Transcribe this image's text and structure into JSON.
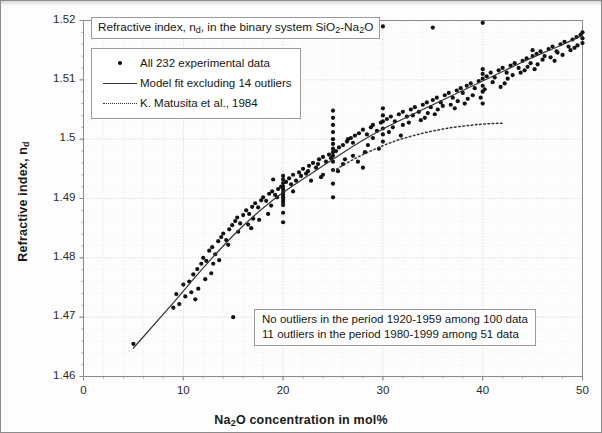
{
  "chart_data": {
    "type": "scatter",
    "title": "Refractive index, nd, in the binary system SiO2-Na2O",
    "title_parts": {
      "lead": "Refractive index, n",
      "sub1": "d",
      "mid": ", in the binary system SiO",
      "sub2": "2",
      "mid2": "-Na",
      "sub3": "2",
      "tail": "O"
    },
    "xlabel": "Na2O concentration in mol%",
    "xlabel_parts": {
      "lead": "Na",
      "sub": "2",
      "tail": "O concentration in mol%"
    },
    "ylabel": "Refractive index, nd",
    "ylabel_parts": {
      "lead": "Refractive index, n",
      "sub": "d"
    },
    "xlim": [
      0,
      50
    ],
    "ylim": [
      1.46,
      1.52
    ],
    "xticks": [
      0,
      10,
      20,
      30,
      40,
      50
    ],
    "xtick_labels": [
      "0",
      "10",
      "20",
      "30",
      "40",
      "50"
    ],
    "yticks": [
      1.46,
      1.47,
      1.48,
      1.49,
      1.5,
      1.51,
      1.52
    ],
    "ytick_labels": [
      "1.46",
      "1.47",
      "1.48",
      "1.49",
      "1.5",
      "1.51",
      "1.52"
    ],
    "x_minor_interval": 2,
    "y_minor_interval": 0.002,
    "grid": true,
    "grid_style": "dotted",
    "grid_color": "#c9c9c9",
    "legend_position": "upper-left",
    "marker_color": "#111111",
    "line_color": "#333333",
    "series": [
      {
        "name": "All 232 experimental data",
        "type": "scatter",
        "marker": "dot",
        "points": [
          [
            5.0,
            1.4655
          ],
          [
            9.3,
            1.4739
          ],
          [
            9.6,
            1.4722
          ],
          [
            10.0,
            1.4755
          ],
          [
            10.2,
            1.4735
          ],
          [
            10.6,
            1.476
          ],
          [
            11.0,
            1.4772
          ],
          [
            11.4,
            1.4781
          ],
          [
            11.8,
            1.479
          ],
          [
            12.0,
            1.48
          ],
          [
            12.3,
            1.4795
          ],
          [
            12.6,
            1.4812
          ],
          [
            12.9,
            1.4818
          ],
          [
            13.2,
            1.4806
          ],
          [
            13.5,
            1.4828
          ],
          [
            13.8,
            1.4835
          ],
          [
            14.0,
            1.4841
          ],
          [
            14.3,
            1.483
          ],
          [
            14.6,
            1.4848
          ],
          [
            14.9,
            1.4855
          ],
          [
            15.0,
            1.47
          ],
          [
            15.2,
            1.4862
          ],
          [
            15.4,
            1.4868
          ],
          [
            15.7,
            1.4858
          ],
          [
            16.0,
            1.4872
          ],
          [
            16.3,
            1.488
          ],
          [
            16.6,
            1.4874
          ],
          [
            16.9,
            1.4886
          ],
          [
            17.2,
            1.4892
          ],
          [
            17.5,
            1.4885
          ],
          [
            17.8,
            1.4897
          ],
          [
            18.0,
            1.4902
          ],
          [
            18.3,
            1.4896
          ],
          [
            18.6,
            1.4908
          ],
          [
            18.9,
            1.4912
          ],
          [
            19.2,
            1.4906
          ],
          [
            19.5,
            1.4916
          ],
          [
            19.8,
            1.492
          ],
          [
            20.0,
            1.4889
          ],
          [
            20.0,
            1.4894
          ],
          [
            20.0,
            1.4898
          ],
          [
            20.0,
            1.4902
          ],
          [
            20.0,
            1.4906
          ],
          [
            20.0,
            1.491
          ],
          [
            20.0,
            1.4915
          ],
          [
            20.0,
            1.492
          ],
          [
            20.0,
            1.4926
          ],
          [
            20.0,
            1.4932
          ],
          [
            20.0,
            1.4938
          ],
          [
            20.0,
            1.486
          ],
          [
            20.0,
            1.4876
          ],
          [
            20.3,
            1.4928
          ],
          [
            20.6,
            1.4934
          ],
          [
            21.0,
            1.494
          ],
          [
            21.3,
            1.493
          ],
          [
            21.6,
            1.4944
          ],
          [
            22.0,
            1.495
          ],
          [
            22.3,
            1.4942
          ],
          [
            22.6,
            1.4955
          ],
          [
            23.0,
            1.496
          ],
          [
            23.3,
            1.4952
          ],
          [
            23.6,
            1.4966
          ],
          [
            24.0,
            1.497
          ],
          [
            24.3,
            1.4962
          ],
          [
            24.6,
            1.4974
          ],
          [
            25.0,
            1.4902
          ],
          [
            25.0,
            1.4925
          ],
          [
            25.0,
            1.4948
          ],
          [
            25.0,
            1.4962
          ],
          [
            25.0,
            1.4972
          ],
          [
            25.0,
            1.4978
          ],
          [
            25.0,
            1.4984
          ],
          [
            25.0,
            1.4992
          ],
          [
            25.0,
            1.5
          ],
          [
            25.0,
            1.5012
          ],
          [
            25.0,
            1.5024
          ],
          [
            25.0,
            1.5036
          ],
          [
            25.0,
            1.5048
          ],
          [
            25.3,
            1.498
          ],
          [
            25.6,
            1.4986
          ],
          [
            26.0,
            1.499
          ],
          [
            26.4,
            1.4996
          ],
          [
            26.8,
            1.5002
          ],
          [
            27.0,
            1.4994
          ],
          [
            27.2,
            1.5006
          ],
          [
            27.6,
            1.501
          ],
          [
            28.0,
            1.5016
          ],
          [
            28.0,
            1.4952
          ],
          [
            28.4,
            1.5008
          ],
          [
            28.8,
            1.502
          ],
          [
            29.0,
            1.5024
          ],
          [
            29.4,
            1.5014
          ],
          [
            29.8,
            1.5028
          ],
          [
            30.0,
            1.503
          ],
          [
            30.0,
            1.504
          ],
          [
            30.0,
            1.5052
          ],
          [
            30.0,
            1.5018
          ],
          [
            30.0,
            1.5008
          ],
          [
            30.0,
            1.4996
          ],
          [
            30.4,
            1.5034
          ],
          [
            30.8,
            1.5038
          ],
          [
            31.2,
            1.503
          ],
          [
            31.6,
            1.5042
          ],
          [
            32.0,
            1.5046
          ],
          [
            32.4,
            1.5038
          ],
          [
            32.8,
            1.505
          ],
          [
            33.2,
            1.5054
          ],
          [
            33.6,
            1.5046
          ],
          [
            34.0,
            1.5058
          ],
          [
            34.4,
            1.5062
          ],
          [
            34.8,
            1.5054
          ],
          [
            35.0,
            1.5066
          ],
          [
            35.0,
            1.5188
          ],
          [
            35.4,
            1.507
          ],
          [
            35.8,
            1.5062
          ],
          [
            36.2,
            1.5074
          ],
          [
            36.6,
            1.5078
          ],
          [
            37.0,
            1.507
          ],
          [
            37.4,
            1.5082
          ],
          [
            37.8,
            1.5086
          ],
          [
            38.0,
            1.5078
          ],
          [
            38.4,
            1.509
          ],
          [
            38.8,
            1.5094
          ],
          [
            39.2,
            1.5086
          ],
          [
            39.6,
            1.5098
          ],
          [
            40.0,
            1.5102
          ],
          [
            40.0,
            1.511
          ],
          [
            40.0,
            1.5118
          ],
          [
            40.0,
            1.509
          ],
          [
            40.0,
            1.508
          ],
          [
            40.0,
            1.5196
          ],
          [
            40.0,
            1.506
          ],
          [
            40.4,
            1.5106
          ],
          [
            40.8,
            1.5112
          ],
          [
            41.2,
            1.5104
          ],
          [
            41.6,
            1.5116
          ],
          [
            42.0,
            1.512
          ],
          [
            42.4,
            1.5112
          ],
          [
            42.8,
            1.5124
          ],
          [
            43.2,
            1.5128
          ],
          [
            43.6,
            1.512
          ],
          [
            44.0,
            1.5132
          ],
          [
            44.4,
            1.5136
          ],
          [
            44.8,
            1.5128
          ],
          [
            45.0,
            1.514
          ],
          [
            45.0,
            1.515
          ],
          [
            45.4,
            1.5144
          ],
          [
            45.8,
            1.5148
          ],
          [
            46.2,
            1.514
          ],
          [
            46.6,
            1.5152
          ],
          [
            47.0,
            1.5156
          ],
          [
            47.4,
            1.5148
          ],
          [
            47.8,
            1.516
          ],
          [
            48.2,
            1.5164
          ],
          [
            48.6,
            1.5156
          ],
          [
            49.0,
            1.5168
          ],
          [
            49.4,
            1.5172
          ],
          [
            49.8,
            1.5176
          ],
          [
            50.0,
            1.518
          ],
          [
            50.0,
            1.517
          ],
          [
            50.0,
            1.5162
          ],
          [
            30.0,
            1.519
          ],
          [
            26.5,
            1.5
          ],
          [
            27.5,
            1.4962
          ],
          [
            22.5,
            1.4946
          ],
          [
            19.0,
            1.4932
          ],
          [
            18.5,
            1.4874
          ],
          [
            17.0,
            1.4866
          ],
          [
            13.0,
            1.479
          ],
          [
            11.5,
            1.4748
          ],
          [
            10.8,
            1.4742
          ],
          [
            12.2,
            1.4764
          ],
          [
            14.5,
            1.4822
          ],
          [
            16.5,
            1.4856
          ],
          [
            21.8,
            1.4938
          ],
          [
            24.8,
            1.4968
          ],
          [
            29.0,
            1.5002
          ],
          [
            33.0,
            1.504
          ],
          [
            36.0,
            1.5056
          ],
          [
            39.0,
            1.5074
          ],
          [
            43.0,
            1.5108
          ],
          [
            46.0,
            1.5134
          ],
          [
            48.0,
            1.5142
          ],
          [
            49.5,
            1.5158
          ],
          [
            31.0,
            1.502
          ],
          [
            34.5,
            1.5044
          ],
          [
            37.5,
            1.5064
          ],
          [
            41.0,
            1.5096
          ],
          [
            44.5,
            1.5122
          ],
          [
            47.5,
            1.5146
          ],
          [
            23.5,
            1.4958
          ],
          [
            20.8,
            1.4924
          ],
          [
            15.5,
            1.4844
          ],
          [
            28.5,
            1.499
          ],
          [
            26.0,
            1.4958
          ],
          [
            35.5,
            1.505
          ],
          [
            38.5,
            1.5068
          ],
          [
            42.5,
            1.5102
          ],
          [
            45.5,
            1.5126
          ],
          [
            32.0,
            1.5024
          ],
          [
            24.0,
            1.494
          ],
          [
            21.0,
            1.4912
          ],
          [
            17.6,
            1.4864
          ],
          [
            13.6,
            1.4796
          ],
          [
            11.2,
            1.473
          ],
          [
            19.4,
            1.4902
          ],
          [
            22.8,
            1.493
          ],
          [
            27.0,
            1.4972
          ],
          [
            30.6,
            1.5012
          ],
          [
            33.8,
            1.5032
          ],
          [
            36.8,
            1.5058
          ],
          [
            40.2,
            1.5084
          ],
          [
            43.8,
            1.5112
          ],
          [
            46.8,
            1.5138
          ],
          [
            49.2,
            1.5154
          ],
          [
            25.5,
            1.4946
          ],
          [
            29.6,
            1.4984
          ],
          [
            31.8,
            1.5006
          ],
          [
            34.2,
            1.5036
          ],
          [
            37.2,
            1.5052
          ],
          [
            39.8,
            1.507
          ],
          [
            42.2,
            1.5094
          ],
          [
            44.2,
            1.5116
          ],
          [
            47.2,
            1.5132
          ],
          [
            48.8,
            1.515
          ],
          [
            9.0,
            1.4716
          ],
          [
            12.8,
            1.4774
          ],
          [
            16.8,
            1.485
          ],
          [
            18.8,
            1.4888
          ],
          [
            23.8,
            1.4936
          ],
          [
            26.2,
            1.4966
          ],
          [
            28.2,
            1.4978
          ],
          [
            32.6,
            1.5028
          ],
          [
            35.2,
            1.5042
          ],
          [
            38.2,
            1.506
          ],
          [
            41.8,
            1.5088
          ],
          [
            45.2,
            1.5118
          ]
        ]
      },
      {
        "name": "Model fit excluding 14 outliers",
        "type": "line",
        "style": "solid",
        "x_start": 5,
        "x_end": 50,
        "points": [
          [
            5,
            1.4648
          ],
          [
            7,
            1.4686
          ],
          [
            9,
            1.4724
          ],
          [
            11,
            1.4764
          ],
          [
            13,
            1.4802
          ],
          [
            15,
            1.4838
          ],
          [
            17,
            1.487
          ],
          [
            19,
            1.4898
          ],
          [
            21,
            1.4922
          ],
          [
            23,
            1.4944
          ],
          [
            25,
            1.4966
          ],
          [
            27,
            1.4988
          ],
          [
            29,
            1.5008
          ],
          [
            31,
            1.5026
          ],
          [
            33,
            1.5042
          ],
          [
            35,
            1.5058
          ],
          [
            37,
            1.5074
          ],
          [
            39,
            1.509
          ],
          [
            41,
            1.5106
          ],
          [
            43,
            1.5122
          ],
          [
            45,
            1.5138
          ],
          [
            47,
            1.5152
          ],
          [
            48.5,
            1.5163
          ],
          [
            50,
            1.5175
          ]
        ]
      },
      {
        "name": "K. Matusita et al., 1984",
        "type": "line",
        "style": "dotted",
        "x_start": 25,
        "x_end": 42,
        "points": [
          [
            25.0,
            1.4946
          ],
          [
            27,
            1.4966
          ],
          [
            29,
            1.4982
          ],
          [
            31,
            1.4996
          ],
          [
            33,
            1.5006
          ],
          [
            35,
            1.5014
          ],
          [
            37,
            1.502
          ],
          [
            39,
            1.5024
          ],
          [
            40.5,
            1.5026
          ],
          [
            42.0,
            1.5027
          ]
        ]
      }
    ],
    "annotations": [
      "No outliers in the period 1920-1959 among 100 data",
      "11 outliers in the period 1980-1999 among 51 data"
    ]
  },
  "legend": {
    "items": [
      {
        "label": "All 232 experimental data",
        "key": "dot-marker-icon"
      },
      {
        "label": "Model fit excluding 14 outliers",
        "key": "solid-line-icon"
      },
      {
        "label": "K. Matusita et al., 1984",
        "key": "dotted-line-icon"
      }
    ]
  }
}
